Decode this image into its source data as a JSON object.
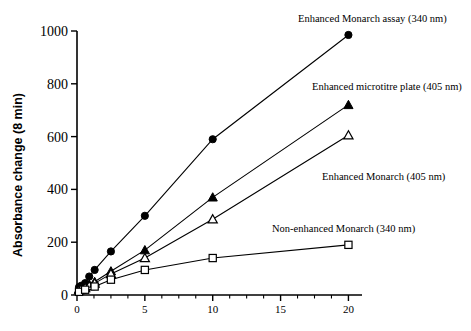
{
  "chart_data": {
    "type": "line",
    "title": "",
    "xlabel": "",
    "ylabel": "Absorbance change (8 min)",
    "xlim": [
      0,
      21
    ],
    "ylim": [
      0,
      1000
    ],
    "xticks": [
      0,
      5,
      10,
      15,
      20
    ],
    "xtick_labels": [
      "0",
      "5",
      "10",
      "15",
      "20"
    ],
    "yticks": [
      0,
      200,
      400,
      600,
      800,
      1000
    ],
    "ytick_labels": [
      "0",
      "200",
      "400",
      "600",
      "800",
      "1000"
    ],
    "x_minor_ticks": [
      1.25,
      2.5,
      3.75,
      6.25,
      7.5,
      8.75,
      11.25,
      12.5,
      13.75,
      16.25,
      17.5,
      18.75
    ],
    "grid": false,
    "legend_position": "inline-annotations",
    "series": [
      {
        "name": "Enhanced Monarch assay (340 nm)",
        "marker": "filled-circle",
        "x": [
          0.15,
          0.3,
          0.6,
          0.9,
          1.3,
          2.5,
          5,
          10,
          20
        ],
        "y": [
          30,
          35,
          45,
          70,
          95,
          165,
          300,
          590,
          985
        ]
      },
      {
        "name": "Enhanced microtitre plate (405 nm)",
        "marker": "filled-triangle",
        "x": [
          0.15,
          0.3,
          0.6,
          0.9,
          1.3,
          2.5,
          5,
          10,
          20
        ],
        "y": [
          22,
          26,
          32,
          40,
          50,
          90,
          170,
          370,
          720
        ]
      },
      {
        "name": "Enhanced Monarch (405 nm)",
        "marker": "open-triangle",
        "x": [
          0.15,
          0.3,
          0.6,
          0.9,
          1.3,
          2.5,
          5,
          10,
          20
        ],
        "y": [
          18,
          22,
          27,
          34,
          44,
          80,
          140,
          287,
          605
        ]
      },
      {
        "name": "Non-enhanced Monarch (340 nm)",
        "marker": "open-square",
        "x": [
          0.15,
          0.6,
          1.3,
          2.5,
          5,
          10,
          20
        ],
        "y": [
          12,
          20,
          32,
          58,
          95,
          140,
          190
        ]
      }
    ],
    "annotations": [
      {
        "text": "Enhanced Monarch assay (340 nm)",
        "series": 0
      },
      {
        "text": "Enhanced microtitre plate (405 nm)",
        "series": 1
      },
      {
        "text": "Enhanced Monarch (405 nm)",
        "series": 2
      },
      {
        "text": "Non-enhanced Monarch (340 nm)",
        "series": 3
      }
    ]
  }
}
